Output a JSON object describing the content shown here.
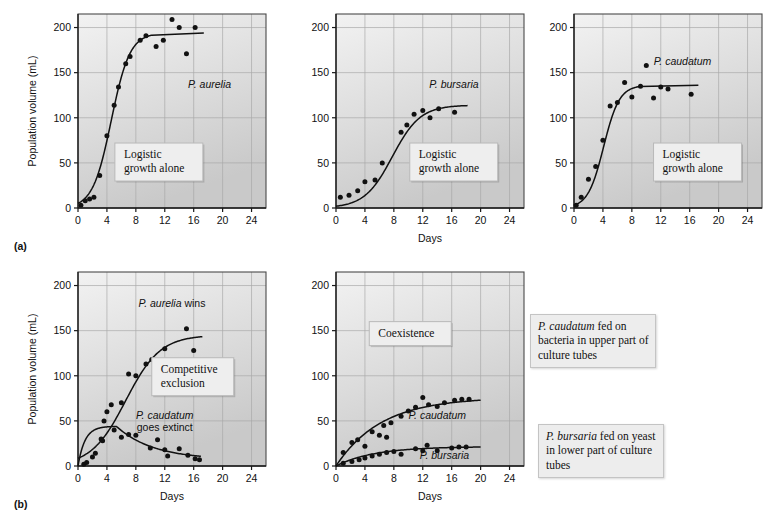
{
  "figure": {
    "panel_a_letter": "(a)",
    "panel_b_letter": "(b)",
    "axis": {
      "ylabel": "Population volume (mL)",
      "xlabel": "Days",
      "yticks": [
        0,
        50,
        100,
        150,
        200
      ],
      "xticks": [
        0,
        4,
        8,
        12,
        16,
        20,
        24
      ],
      "ylim": [
        0,
        215
      ],
      "xlim": [
        0,
        26
      ]
    },
    "side_notes": [
      {
        "name": "note-caudatum-bacteria",
        "species": "P. caudatum",
        "text": " fed on bacteria in upper part of culture tubes"
      },
      {
        "name": "note-bursaria-yeast",
        "species": "P. bursaria",
        "text": " fed on yeast in lower part of culture tubes"
      }
    ]
  },
  "chart_data": [
    {
      "id": "a1",
      "type": "scatter",
      "title": "",
      "xlabel": "",
      "ylabel": "Population volume (mL)",
      "xlim": [
        0,
        26
      ],
      "ylim": [
        0,
        215
      ],
      "xticks": [
        0,
        4,
        8,
        12,
        16,
        20,
        24
      ],
      "yticks": [
        0,
        50,
        100,
        150,
        200
      ],
      "grid": true,
      "callout": "Logistic\ngrowth alone",
      "annotations": [
        {
          "label": "P. aurelia",
          "italic": true,
          "x": 18.2,
          "y": 133
        }
      ],
      "series": [
        {
          "name": "P. aurelia",
          "points": [
            [
              0.4,
              3
            ],
            [
              1.0,
              8
            ],
            [
              1.6,
              10
            ],
            [
              2.2,
              12
            ],
            [
              3.0,
              36
            ],
            [
              4.0,
              80
            ],
            [
              5.0,
              114
            ],
            [
              5.6,
              134
            ],
            [
              6.6,
              160
            ],
            [
              7.2,
              168
            ],
            [
              8.6,
              186
            ],
            [
              9.4,
              191
            ],
            [
              10.8,
              179
            ],
            [
              11.8,
              186
            ],
            [
              13.0,
              209
            ],
            [
              14.0,
              200
            ],
            [
              15.0,
              171
            ],
            [
              16.2,
              200
            ]
          ],
          "fit": {
            "kind": "logistic",
            "K": 194,
            "r": 0.78,
            "x0": 4.6,
            "x_range": [
              0,
              10.2
            ],
            "plateau_to": 17.4
          }
        }
      ]
    },
    {
      "id": "a2",
      "type": "scatter",
      "title": "",
      "xlabel": "Days",
      "ylabel": "",
      "xlim": [
        0,
        26
      ],
      "ylim": [
        0,
        215
      ],
      "xticks": [
        0,
        4,
        8,
        12,
        16,
        20,
        24
      ],
      "yticks": [
        0,
        50,
        100,
        150,
        200
      ],
      "grid": true,
      "callout": "Logistic\ngrowth alone",
      "annotations": [
        {
          "label": "P. bursaria",
          "italic": true,
          "x": 16.3,
          "y": 133
        }
      ],
      "series": [
        {
          "name": "P. bursaria",
          "points": [
            [
              0.6,
              12
            ],
            [
              1.8,
              14
            ],
            [
              3.0,
              19
            ],
            [
              4.0,
              29
            ],
            [
              5.4,
              31
            ],
            [
              6.4,
              50
            ],
            [
              9.0,
              84
            ],
            [
              9.8,
              92
            ],
            [
              10.8,
              104
            ],
            [
              12.0,
              108
            ],
            [
              13.0,
              100
            ],
            [
              14.2,
              110
            ],
            [
              16.4,
              106
            ]
          ],
          "fit": {
            "kind": "logistic",
            "K": 114,
            "r": 0.52,
            "x0": 7.8,
            "x_range": [
              0,
              18.2
            ],
            "plateau_to": 18.2
          }
        }
      ]
    },
    {
      "id": "a3",
      "type": "scatter",
      "title": "",
      "xlabel": "",
      "ylabel": "",
      "xlim": [
        0,
        26
      ],
      "ylim": [
        0,
        215
      ],
      "xticks": [
        0,
        4,
        8,
        12,
        16,
        20,
        24
      ],
      "yticks": [
        0,
        50,
        100,
        150,
        200
      ],
      "grid": true,
      "callout": "Logistic\ngrowth alone",
      "annotations": [
        {
          "label": "P. caudatum",
          "italic": true,
          "x": 15.0,
          "y": 158
        }
      ],
      "series": [
        {
          "name": "P. caudatum",
          "points": [
            [
              0.3,
              3
            ],
            [
              1.0,
              12
            ],
            [
              2.0,
              32
            ],
            [
              3.0,
              46
            ],
            [
              4.0,
              75
            ],
            [
              5.0,
              113
            ],
            [
              6.0,
              117
            ],
            [
              7.0,
              139
            ],
            [
              8.0,
              123
            ],
            [
              9.2,
              135
            ],
            [
              10.0,
              158
            ],
            [
              11.0,
              122
            ],
            [
              12.0,
              134
            ],
            [
              13.0,
              132
            ],
            [
              16.2,
              126
            ]
          ],
          "fit": {
            "kind": "logistic",
            "K": 136,
            "r": 0.92,
            "x0": 4.1,
            "x_range": [
              0,
              9.2
            ],
            "plateau_to": 17.2
          }
        }
      ]
    },
    {
      "id": "b1",
      "type": "scatter",
      "title": "",
      "xlabel": "Days",
      "ylabel": "Population volume (mL)",
      "xlim": [
        0,
        26
      ],
      "ylim": [
        0,
        215
      ],
      "xticks": [
        0,
        4,
        8,
        12,
        16,
        20,
        24
      ],
      "yticks": [
        0,
        50,
        100,
        150,
        200
      ],
      "grid": true,
      "callout": "Competitive\nexclusion",
      "annotations": [
        {
          "label": "P. aurelia",
          "suffix": " wins",
          "italic": true,
          "x": 13.0,
          "y": 176
        },
        {
          "label": "P. caudatum",
          "suffix": "goes extinct",
          "italic": true,
          "x": 12.0,
          "y": 52
        }
      ],
      "series": [
        {
          "name": "P. aurelia",
          "points": [
            [
              0.8,
              2
            ],
            [
              2.0,
              10
            ],
            [
              3.2,
              30
            ],
            [
              3.6,
              50
            ],
            [
              4.0,
              60
            ],
            [
              4.6,
              68
            ],
            [
              6.0,
              70
            ],
            [
              7.0,
              102
            ],
            [
              8.0,
              100
            ],
            [
              9.4,
              113
            ],
            [
              10.2,
              118
            ],
            [
              12.0,
              130
            ],
            [
              15.0,
              152
            ],
            [
              16.0,
              128
            ]
          ],
          "fit": {
            "kind": "logistic",
            "K": 145,
            "r": 0.42,
            "x0": 6.6,
            "x_range": [
              0,
              17.2
            ],
            "plateau_to": 17.2
          }
        },
        {
          "name": "P. caudatum",
          "points": [
            [
              1.2,
              4
            ],
            [
              2.4,
              14
            ],
            [
              3.4,
              28
            ],
            [
              5.0,
              40
            ],
            [
              6.0,
              32
            ],
            [
              7.0,
              35
            ],
            [
              8.0,
              34
            ],
            [
              10.0,
              20
            ],
            [
              11.0,
              29
            ],
            [
              12.0,
              18
            ],
            [
              12.4,
              11
            ],
            [
              14.0,
              19
            ],
            [
              15.2,
              12
            ],
            [
              16.2,
              8
            ],
            [
              16.8,
              7
            ]
          ],
          "fit": {
            "kind": "hump",
            "peak_x": 5.3,
            "peak_y": 44,
            "end_x": 17.0,
            "end_y": 7
          }
        }
      ]
    },
    {
      "id": "b2",
      "type": "scatter",
      "title": "",
      "xlabel": "Days",
      "ylabel": "",
      "xlim": [
        0,
        26
      ],
      "ylim": [
        0,
        215
      ],
      "xticks": [
        0,
        4,
        8,
        12,
        16,
        20,
        24
      ],
      "yticks": [
        0,
        50,
        100,
        150,
        200
      ],
      "grid": true,
      "callout": "Coexistence",
      "annotations": [
        {
          "label": "P. caudatum",
          "italic": true,
          "x": 14.0,
          "y": 52
        },
        {
          "label": "P. bursaria",
          "italic": true,
          "x": 15.0,
          "y": 8
        }
      ],
      "series": [
        {
          "name": "P. caudatum",
          "points": [
            [
              1.0,
              15
            ],
            [
              2.2,
              26
            ],
            [
              3.0,
              29
            ],
            [
              4.0,
              22
            ],
            [
              5.0,
              38
            ],
            [
              6.0,
              34
            ],
            [
              6.6,
              45
            ],
            [
              7.0,
              32
            ],
            [
              7.6,
              48
            ],
            [
              9.0,
              55
            ],
            [
              10.0,
              61
            ],
            [
              11.0,
              65
            ],
            [
              12.0,
              76
            ],
            [
              12.8,
              68
            ],
            [
              14.0,
              66
            ],
            [
              15.0,
              70
            ],
            [
              16.4,
              73
            ],
            [
              17.4,
              74
            ],
            [
              18.4,
              74
            ]
          ],
          "fit": {
            "kind": "saturating",
            "K": 76,
            "r": 0.16,
            "x_range": [
              0,
              20.0
            ]
          }
        },
        {
          "name": "P. bursaria",
          "points": [
            [
              1.0,
              3
            ],
            [
              2.2,
              5
            ],
            [
              3.2,
              7
            ],
            [
              4.0,
              9
            ],
            [
              5.0,
              11
            ],
            [
              6.0,
              13
            ],
            [
              7.0,
              15
            ],
            [
              8.0,
              16
            ],
            [
              9.0,
              13
            ],
            [
              11.0,
              19
            ],
            [
              12.0,
              17
            ],
            [
              12.6,
              23
            ],
            [
              14.0,
              17
            ],
            [
              16.0,
              20
            ],
            [
              17.0,
              21
            ],
            [
              18.0,
              21
            ]
          ],
          "fit": {
            "kind": "saturating",
            "K": 21.5,
            "r": 0.19,
            "x_range": [
              0,
              20.0
            ]
          }
        }
      ]
    }
  ]
}
